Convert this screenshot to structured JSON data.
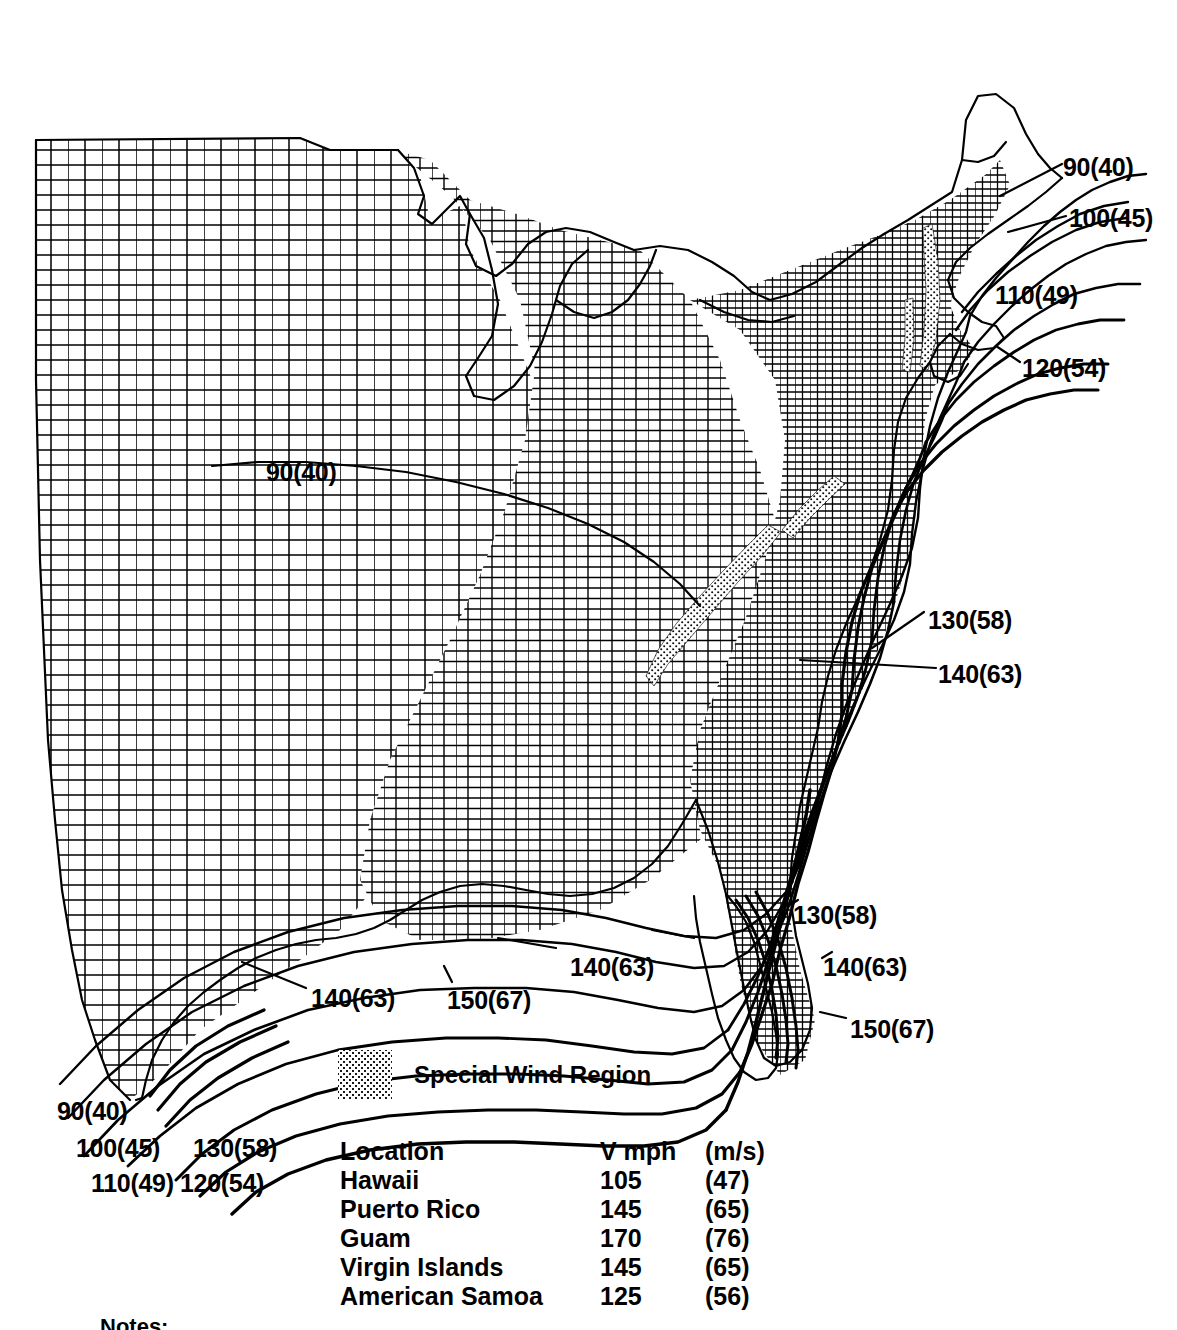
{
  "figure": {
    "kind": "contour-map",
    "region": "Continental United States",
    "background_color": "#ffffff",
    "line_color": "#000000"
  },
  "wind_labels": [
    {
      "id": "ne-90",
      "text": "90(40)",
      "x": 1063,
      "y": 155,
      "region": "northeast-offshore"
    },
    {
      "id": "ne-100",
      "text": "100(45)",
      "x": 1069,
      "y": 206,
      "region": "northeast-offshore"
    },
    {
      "id": "ne-110",
      "text": "110(49)",
      "x": 995,
      "y": 283,
      "region": "new-england-coast"
    },
    {
      "id": "ne-120",
      "text": "120(54)",
      "x": 1022,
      "y": 356,
      "region": "cape-cod"
    },
    {
      "id": "interior-90",
      "text": "90(40)",
      "x": 266,
      "y": 460,
      "region": "great-plains-interior"
    },
    {
      "id": "mid-130",
      "text": "130(58)",
      "x": 928,
      "y": 608,
      "region": "mid-atlantic-coast"
    },
    {
      "id": "mid-140",
      "text": "140(63)",
      "x": 938,
      "y": 662,
      "region": "mid-atlantic-offshore"
    },
    {
      "id": "fl-130",
      "text": "130(58)",
      "x": 793,
      "y": 903,
      "region": "florida-atlantic"
    },
    {
      "id": "fl-140",
      "text": "140(63)",
      "x": 823,
      "y": 955,
      "region": "florida-atlantic"
    },
    {
      "id": "fl-150",
      "text": "150(67)",
      "x": 850,
      "y": 1017,
      "region": "south-florida"
    },
    {
      "id": "gulf-e-140",
      "text": "140(63)",
      "x": 570,
      "y": 955,
      "region": "gulf-coast-east"
    },
    {
      "id": "gulf-150",
      "text": "150(67)",
      "x": 447,
      "y": 988,
      "region": "gulf-coast-louisiana"
    },
    {
      "id": "gulf-w-140",
      "text": "140(63)",
      "x": 311,
      "y": 986,
      "region": "gulf-coast-texas"
    },
    {
      "id": "tx-90",
      "text": "90(40)",
      "x": 57,
      "y": 1099,
      "region": "texas-southwest"
    },
    {
      "id": "tx-100",
      "text": "100(45)",
      "x": 76,
      "y": 1136,
      "region": "texas-southwest"
    },
    {
      "id": "tx-130",
      "text": "130(58)",
      "x": 193,
      "y": 1136,
      "region": "texas-coast"
    },
    {
      "id": "tx-110",
      "text": "110(49)",
      "x": 91,
      "y": 1171,
      "region": "texas-southwest"
    },
    {
      "id": "tx-120",
      "text": "120(54)",
      "x": 180,
      "y": 1171,
      "region": "texas-coast"
    }
  ],
  "legend": {
    "swatch_name": "special-wind-region-swatch",
    "label": "Special Wind Region"
  },
  "location_table": {
    "headers": [
      "Location",
      "V mph",
      "(m/s)"
    ],
    "rows": [
      {
        "location": "Hawaii",
        "mph": "105",
        "ms": "(47)"
      },
      {
        "location": "Puerto Rico",
        "mph": "145",
        "ms": "(65)"
      },
      {
        "location": "Guam",
        "mph": "170",
        "ms": "(76)"
      },
      {
        "location": "Virgin Islands",
        "mph": "145",
        "ms": "(65)"
      },
      {
        "location": "American Samoa",
        "mph": "125",
        "ms": "(56)"
      }
    ]
  },
  "bottom_note": {
    "text": "Notes:"
  }
}
